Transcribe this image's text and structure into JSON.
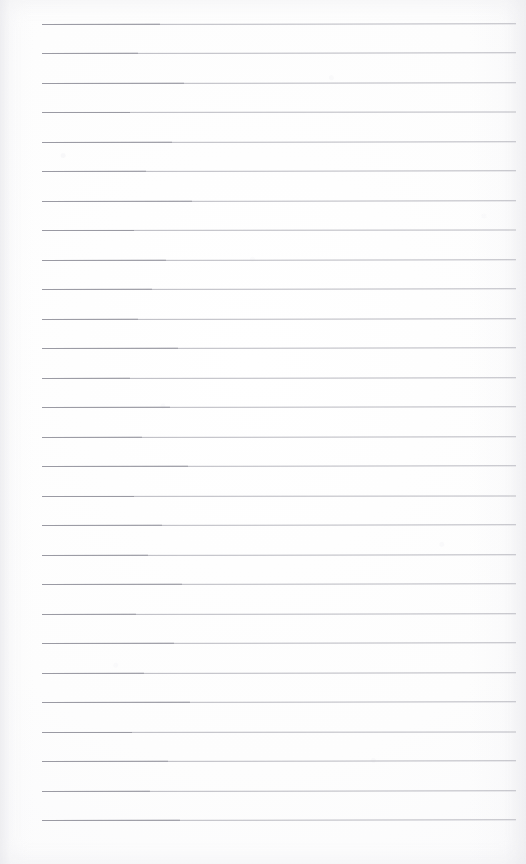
{
  "document": {
    "type": "scanned-lined-notepad-page",
    "title": "Blank lined notepad page",
    "visible_text": "",
    "page_width": 526,
    "page_height": 864,
    "paper_color": "#fdfdfd",
    "background_color": "#ffffff"
  },
  "ruling": {
    "line_color": "#b9b9c0",
    "line_color_strong": "#9a9aa3",
    "line_thickness": 1,
    "line_count": 28,
    "first_line_y": 24,
    "line_spacing": 29.5,
    "line_start_x": 42,
    "line_end_x": 516,
    "line_length": 474
  },
  "margins": {
    "left": 42,
    "right": 10,
    "top": 24,
    "bottom": 45
  },
  "lines": [
    {
      "index": 1,
      "y": 24,
      "left": 42,
      "width": 474,
      "strong_left_width": 118,
      "tilt": -0.1
    },
    {
      "index": 2,
      "y": 53,
      "left": 42,
      "width": 474,
      "strong_left_width": 96,
      "tilt": -0.08
    },
    {
      "index": 3,
      "y": 83,
      "left": 42,
      "width": 474,
      "strong_left_width": 142,
      "tilt": -0.09
    },
    {
      "index": 4,
      "y": 112,
      "left": 42,
      "width": 474,
      "strong_left_width": 88,
      "tilt": -0.07
    },
    {
      "index": 5,
      "y": 142,
      "left": 42,
      "width": 474,
      "strong_left_width": 130,
      "tilt": -0.1
    },
    {
      "index": 6,
      "y": 171,
      "left": 42,
      "width": 474,
      "strong_left_width": 104,
      "tilt": -0.08
    },
    {
      "index": 7,
      "y": 201,
      "left": 42,
      "width": 474,
      "strong_left_width": 150,
      "tilt": -0.09
    },
    {
      "index": 8,
      "y": 230,
      "left": 42,
      "width": 474,
      "strong_left_width": 92,
      "tilt": -0.07
    },
    {
      "index": 9,
      "y": 260,
      "left": 42,
      "width": 474,
      "strong_left_width": 124,
      "tilt": -0.1
    },
    {
      "index": 10,
      "y": 289,
      "left": 42,
      "width": 474,
      "strong_left_width": 110,
      "tilt": -0.08
    },
    {
      "index": 11,
      "y": 319,
      "left": 42,
      "width": 474,
      "strong_left_width": 96,
      "tilt": -0.09
    },
    {
      "index": 12,
      "y": 348,
      "left": 42,
      "width": 474,
      "strong_left_width": 136,
      "tilt": -0.08
    },
    {
      "index": 13,
      "y": 378,
      "left": 42,
      "width": 474,
      "strong_left_width": 88,
      "tilt": -0.09
    },
    {
      "index": 14,
      "y": 407,
      "left": 42,
      "width": 474,
      "strong_left_width": 128,
      "tilt": -0.1
    },
    {
      "index": 15,
      "y": 437,
      "left": 42,
      "width": 474,
      "strong_left_width": 100,
      "tilt": -0.08
    },
    {
      "index": 16,
      "y": 466,
      "left": 42,
      "width": 474,
      "strong_left_width": 146,
      "tilt": -0.09
    },
    {
      "index": 17,
      "y": 496,
      "left": 42,
      "width": 474,
      "strong_left_width": 92,
      "tilt": -0.07
    },
    {
      "index": 18,
      "y": 525,
      "left": 42,
      "width": 474,
      "strong_left_width": 120,
      "tilt": -0.1
    },
    {
      "index": 19,
      "y": 555,
      "left": 42,
      "width": 474,
      "strong_left_width": 106,
      "tilt": -0.08
    },
    {
      "index": 20,
      "y": 584,
      "left": 42,
      "width": 474,
      "strong_left_width": 140,
      "tilt": -0.09
    },
    {
      "index": 21,
      "y": 614,
      "left": 42,
      "width": 474,
      "strong_left_width": 94,
      "tilt": -0.08
    },
    {
      "index": 22,
      "y": 643,
      "left": 42,
      "width": 474,
      "strong_left_width": 132,
      "tilt": -0.1
    },
    {
      "index": 23,
      "y": 673,
      "left": 42,
      "width": 474,
      "strong_left_width": 102,
      "tilt": -0.08
    },
    {
      "index": 24,
      "y": 702,
      "left": 42,
      "width": 474,
      "strong_left_width": 148,
      "tilt": -0.09
    },
    {
      "index": 25,
      "y": 732,
      "left": 42,
      "width": 474,
      "strong_left_width": 90,
      "tilt": -0.07
    },
    {
      "index": 26,
      "y": 761,
      "left": 42,
      "width": 474,
      "strong_left_width": 126,
      "tilt": -0.1
    },
    {
      "index": 27,
      "y": 791,
      "left": 42,
      "width": 474,
      "strong_left_width": 108,
      "tilt": -0.08
    },
    {
      "index": 28,
      "y": 820,
      "left": 42,
      "width": 474,
      "strong_left_width": 138,
      "tilt": -0.09
    }
  ]
}
